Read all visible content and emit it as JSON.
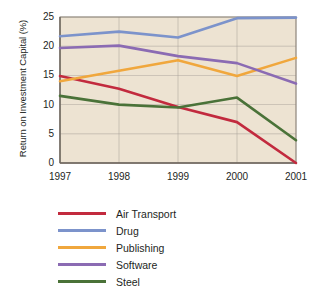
{
  "chart_data": {
    "type": "line",
    "title": "",
    "xlabel": "",
    "ylabel": "Return on Investment Capital (%)",
    "categories": [
      "1997",
      "1998",
      "1999",
      "2000",
      "2001"
    ],
    "x": [
      1997,
      1998,
      1999,
      2000,
      2001
    ],
    "ylim": [
      0,
      25
    ],
    "yticks": [
      0,
      5,
      10,
      15,
      20,
      25
    ],
    "ytick_labels": [
      "0",
      "5",
      "10",
      "15",
      "20",
      "25"
    ],
    "grid": true,
    "legend_position": "below",
    "plot_background": "#EDE3D2",
    "gridline_color": "#A9A29A",
    "series": [
      {
        "name": "Air Transport",
        "color": "#C22A3E",
        "values": [
          14.9,
          12.7,
          9.6,
          7.0,
          0.0
        ]
      },
      {
        "name": "Drug",
        "color": "#7C93CB",
        "values": [
          21.7,
          22.5,
          21.5,
          24.8,
          24.9
        ]
      },
      {
        "name": "Publishing",
        "color": "#F0A73D",
        "values": [
          14.0,
          15.8,
          17.6,
          14.9,
          18.0
        ]
      },
      {
        "name": "Software",
        "color": "#8B6BB3",
        "values": [
          19.7,
          20.1,
          18.3,
          17.1,
          13.6
        ]
      },
      {
        "name": "Steel",
        "color": "#4A7238",
        "values": [
          11.5,
          10.0,
          9.5,
          11.2,
          3.9
        ]
      }
    ]
  },
  "legend": {
    "items": [
      {
        "label": "Air Transport"
      },
      {
        "label": "Drug"
      },
      {
        "label": "Publishing"
      },
      {
        "label": "Software"
      },
      {
        "label": "Steel"
      }
    ]
  }
}
